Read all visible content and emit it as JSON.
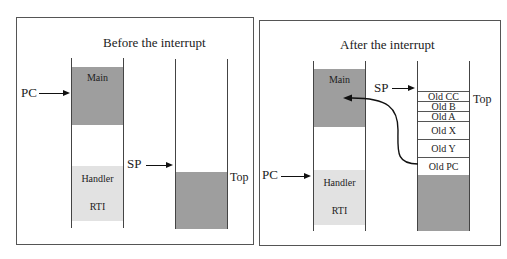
{
  "panels": {
    "before": {
      "title": "Before the interrupt",
      "memory": {
        "main_label": "Main",
        "handler_label": "Handler",
        "rti_label": "RTI"
      },
      "pc_label": "PC",
      "sp_label": "SP",
      "top_label": "Top"
    },
    "after": {
      "title": "After the interrupt",
      "memory": {
        "main_label": "Main",
        "handler_label": "Handler",
        "rti_label": "RTI"
      },
      "pc_label": "PC",
      "sp_label": "SP",
      "top_label": "Top",
      "stack_frame": [
        "Old CC",
        "Old B",
        "Old A",
        "Old X",
        "Old Y",
        "Old PC"
      ]
    }
  },
  "colors": {
    "main_block": "#9e9e9e",
    "handler_block": "#e2e2e2",
    "stack_used": "#9e9e9e"
  }
}
